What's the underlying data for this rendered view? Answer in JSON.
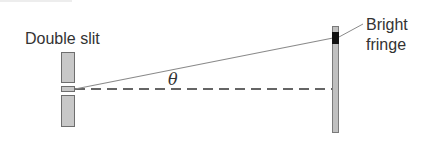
{
  "diagram": {
    "labels": {
      "slit": "Double slit",
      "fringe_line1": "Bright",
      "fringe_line2": "fringe",
      "angle": "θ"
    },
    "colors": {
      "slit_fill": "#c8c8c8",
      "slit_stroke": "#6e6e6e",
      "screen_fill": "#c0c0c0",
      "fringe": "#111111",
      "ray": "#8a8a8a",
      "axis": "#333333",
      "text": "#333333"
    }
  }
}
